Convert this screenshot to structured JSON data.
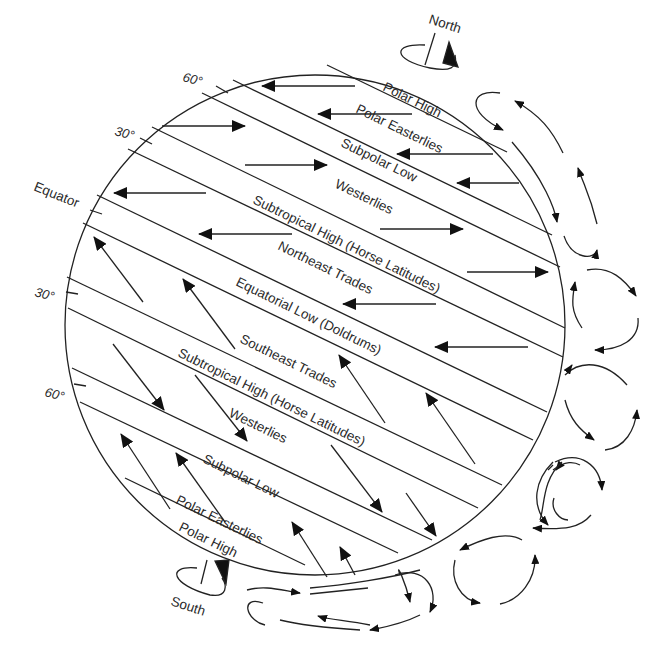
{
  "diagram": {
    "poles": {
      "north": "North",
      "south": "South"
    },
    "latitude_marks": {
      "n60": "60°",
      "n30": "30°",
      "equator": "Equator",
      "s30": "30°",
      "s60": "60°"
    },
    "belts": {
      "north_polar_high": "Polar High",
      "north_polar_easterlies": "Polar Easterlies",
      "north_subpolar_low": "Subpolar Low",
      "north_westerlies": "Westerlies",
      "north_subtropical_high": "Subtropical High (Horse Latitudes)",
      "northeast_trades": "Northeast Trades",
      "equatorial_low": "Equatorial Low (Doldrums)",
      "southeast_trades": "Southeast Trades",
      "south_subtropical_high": "Subtropical High (Horse Latitudes)",
      "south_westerlies": "Westerlies",
      "south_subpolar_low": "Subpolar Low",
      "south_polar_easterlies": "Polar Easterlies",
      "south_polar_high": "Polar High"
    },
    "colors": {
      "line": "#222222",
      "text": "#2a2a2a",
      "background": "#ffffff"
    }
  }
}
